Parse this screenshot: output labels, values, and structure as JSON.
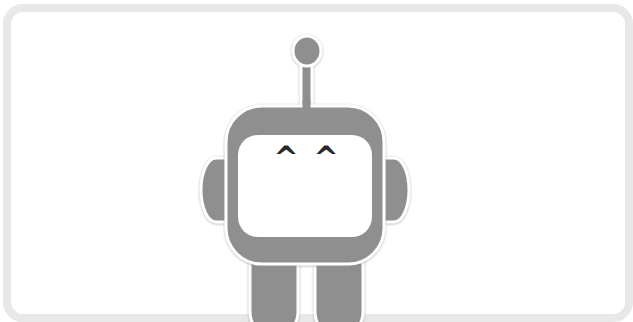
{
  "illustration": {
    "subject": "robot-mascot",
    "face": {
      "left_eye": "^",
      "right_eye": "^"
    }
  },
  "colors": {
    "frame_border": "#e8e8e8",
    "background": "#ffffff",
    "robot_body": "#8f8f8f",
    "outline": "#ffffff",
    "outline_shadow": "#c8c8c8",
    "eye": "#2a2a2a"
  }
}
